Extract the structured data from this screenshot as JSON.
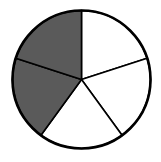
{
  "figure": {
    "fraction_shaded": "2/5"
  },
  "chart_data": {
    "type": "pie",
    "title": "",
    "categories": [
      "part 1",
      "part 2",
      "part 3",
      "part 4",
      "part 5"
    ],
    "values": [
      1,
      1,
      1,
      1,
      1
    ],
    "shaded": [
      false,
      false,
      false,
      true,
      true
    ],
    "start_angle_deg": -90,
    "direction": "clockwise",
    "colors": {
      "shaded": "#5a5a5a",
      "unshaded": "#ffffff",
      "stroke": "#000000"
    },
    "geometry": {
      "cx": 81.5,
      "cy": 79.5,
      "r": 69
    }
  }
}
